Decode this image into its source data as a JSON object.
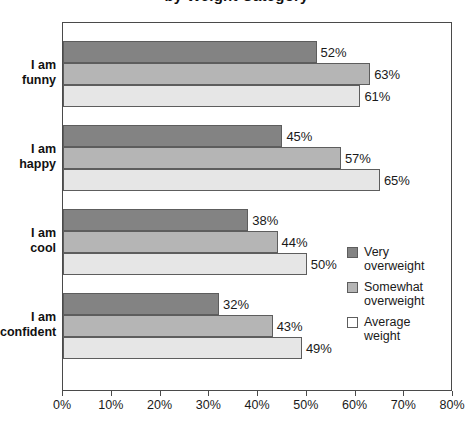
{
  "chart_data": {
    "type": "bar",
    "orientation": "horizontal",
    "title": "by Weight Category",
    "xlabel": "",
    "ylabel": "",
    "xlim": [
      0,
      80
    ],
    "xtick_labels": [
      "0%",
      "10%",
      "20%",
      "30%",
      "40%",
      "50%",
      "60%",
      "70%",
      "80%"
    ],
    "xtick_values": [
      0,
      10,
      20,
      30,
      40,
      50,
      60,
      70,
      80
    ],
    "grid": false,
    "legend_position": "center-right",
    "categories": [
      "I am funny",
      "I am happy",
      "I am cool",
      "I am confident"
    ],
    "category_lines": [
      [
        "I am",
        "funny"
      ],
      [
        "I am",
        "happy"
      ],
      [
        "I am",
        "cool"
      ],
      [
        "I am",
        "confident"
      ]
    ],
    "series": [
      {
        "name": "Very overweight",
        "name_lines": [
          "Very",
          "overweight"
        ],
        "color": "#838383",
        "values": [
          52,
          45,
          38,
          32
        ],
        "labels": [
          "52%",
          "45%",
          "38%",
          "32%"
        ]
      },
      {
        "name": "Somewhat overweight",
        "name_lines": [
          "Somewhat",
          "overweight"
        ],
        "color": "#b5b5b5",
        "values": [
          63,
          57,
          44,
          43
        ],
        "labels": [
          "63%",
          "57%",
          "44%",
          "43%"
        ]
      },
      {
        "name": "Average weight",
        "name_lines": [
          "Average",
          "weight"
        ],
        "color": "#e6e6e6",
        "values": [
          61,
          65,
          50,
          49
        ],
        "labels": [
          "61%",
          "65%",
          "50%",
          "49%"
        ]
      }
    ]
  },
  "colors": {
    "axis": "#4a4a4a",
    "bar_border": "#5d5d5d",
    "text": "#1a1a1a",
    "background": "#ffffff"
  }
}
